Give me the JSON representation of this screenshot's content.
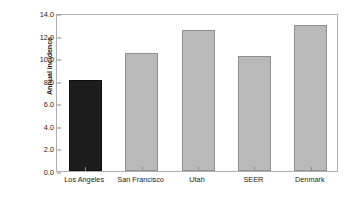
{
  "chart_data": {
    "type": "bar",
    "title": "",
    "xlabel": "",
    "ylabel": "Annual incidence (per 100,000)",
    "ylabel_lines": [
      "Annual incidence",
      "(per 100,000)"
    ],
    "categories": [
      "Los Angeles",
      "San Francisco",
      "Utah",
      "SEER",
      "Denmark"
    ],
    "values": [
      8.05,
      10.5,
      12.5,
      10.2,
      12.9
    ],
    "ylim": [
      0.0,
      14.0
    ],
    "ytick_step": 2.0,
    "ytick_labels": [
      "0.0",
      "2.0",
      "4.0",
      "6.0",
      "8.0",
      "10.0",
      "12.0",
      "14.0"
    ],
    "ytick_values": [
      0.0,
      2.0,
      4.0,
      6.0,
      8.0,
      10.0,
      12.0,
      14.0
    ],
    "grid": false,
    "legend": "none",
    "bar_colors": [
      "#1d1d1d",
      "#b9b9b9",
      "#b9b9b9",
      "#b9b9b9",
      "#b9b9b9"
    ],
    "bar_border_colors": [
      "#0d0d0d",
      "#8f8f8f",
      "#8f8f8f",
      "#8f8f8f",
      "#8f8f8f"
    ],
    "highlight_category": "Los Angeles"
  },
  "colors": {
    "axis": "#b0b0b0",
    "tick": "#8a8a8a",
    "text": "#1c1c1c",
    "background": "#ffffff",
    "highlight_bar": "#1d1d1d",
    "default_bar": "#b9b9b9"
  }
}
